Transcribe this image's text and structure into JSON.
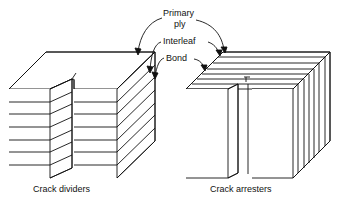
{
  "labels": {
    "primary_ply_line1": "Primary",
    "primary_ply_line2": "ply",
    "interleaf": "Interleaf",
    "bond": "Bond"
  },
  "captions": {
    "left": "Crack dividers",
    "right": "Crack arresters"
  },
  "colors": {
    "line": "#111111",
    "background": "#ffffff"
  }
}
